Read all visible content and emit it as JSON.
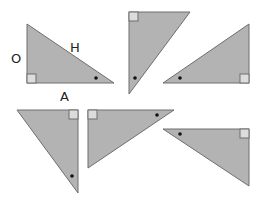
{
  "diagram": {
    "colors": {
      "fill": "#b3b3b3",
      "stroke": "#6e6e6e",
      "right_angle_marker": "#dcdcdc",
      "angle_dot": "#111111",
      "background": "#ffffff"
    },
    "labels": {
      "opposite": "O",
      "hypotenuse": "H",
      "adjacent": "A"
    },
    "triangles": [
      {
        "id": 1,
        "position": "top-left",
        "right_angle": "bottom-left",
        "marked_angle": "bottom-right",
        "labeled": true
      },
      {
        "id": 2,
        "position": "top-middle",
        "right_angle": "top-left",
        "marked_angle": "bottom-left",
        "labeled": false
      },
      {
        "id": 3,
        "position": "top-right",
        "right_angle": "bottom-right",
        "marked_angle": "bottom-left",
        "labeled": false
      },
      {
        "id": 4,
        "position": "bottom-left",
        "right_angle": "top-right",
        "marked_angle": "bottom-right",
        "labeled": false
      },
      {
        "id": 5,
        "position": "bottom-middle",
        "right_angle": "top-left",
        "marked_angle": "top-right",
        "labeled": false
      },
      {
        "id": 6,
        "position": "bottom-right",
        "right_angle": "top-right",
        "marked_angle": "top-left",
        "labeled": false
      }
    ]
  }
}
